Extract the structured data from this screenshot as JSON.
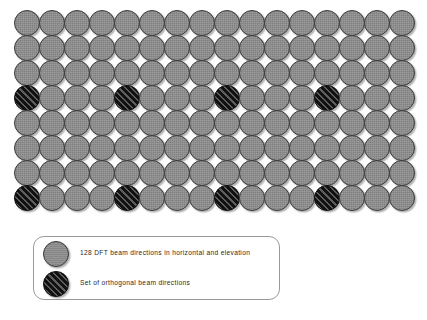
{
  "figure": {
    "type": "diagram"
  },
  "grid": {
    "columns": 16,
    "rows": 8,
    "total_beams": 128,
    "origin_x": 14,
    "origin_y": 10,
    "step_x": 25,
    "step_y": 25,
    "diameter": 26,
    "plain_color": "#8f8f8f",
    "hatched_color": "#1b1b1b",
    "outline_color": "#3a3a3a",
    "orthogonal_columns": [
      1,
      5,
      9,
      13
    ],
    "orthogonal_rows": [
      4,
      8
    ]
  },
  "legend": {
    "border_color": "#9a9a9a",
    "items": [
      {
        "style": "plain",
        "swatch_name": "legend-swatch-dft-beams",
        "label": "128 DFT beam directions in horizontal and elevation"
      },
      {
        "style": "hatched",
        "swatch_name": "legend-swatch-orthogonal-beams",
        "label": "Set of orthogonal beam directions"
      }
    ]
  }
}
